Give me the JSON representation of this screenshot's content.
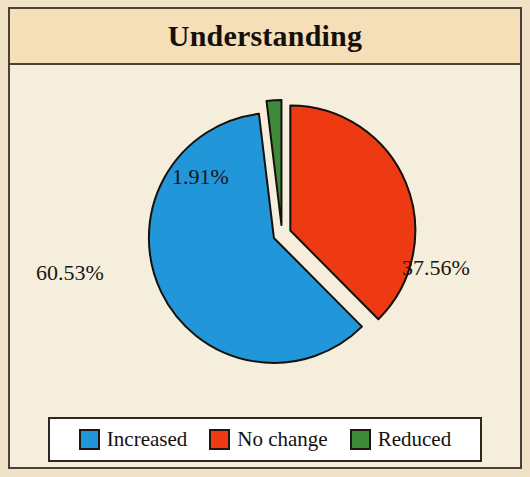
{
  "chart": {
    "title": "Understanding",
    "legend": {
      "items": [
        {
          "label": "Increased",
          "color": "#2196d8"
        },
        {
          "label": "No change",
          "color": "#ee3a13"
        },
        {
          "label": "Reduced",
          "color": "#3f8a3a"
        }
      ]
    },
    "labels": {
      "increased": "60.53%",
      "no_change": "37.56%",
      "reduced": "1.91%"
    }
  },
  "chart_data": {
    "type": "pie",
    "title": "Understanding",
    "exploded": true,
    "start_angle_deg": 0,
    "direction": "clockwise",
    "categories": [
      "No change",
      "Increased",
      "Reduced"
    ],
    "values": [
      37.56,
      60.53,
      1.91
    ],
    "unit": "percent",
    "colors": [
      "#ee3a13",
      "#2196d8",
      "#3f8a3a"
    ],
    "data_labels": [
      "37.56%",
      "60.53%",
      "1.91%"
    ],
    "legend_entries": [
      "Increased",
      "No change",
      "Reduced"
    ],
    "legend_position": "bottom",
    "xlabel": "",
    "ylabel": "",
    "grid": false,
    "slices": [
      {
        "name": "No change",
        "value": 37.56,
        "label": "37.56%",
        "color": "#ee3a13",
        "start_deg": 0.0,
        "sweep_deg": 135.22
      },
      {
        "name": "Increased",
        "value": 60.53,
        "label": "60.53%",
        "color": "#2196d8",
        "start_deg": 135.22,
        "sweep_deg": 217.91
      },
      {
        "name": "Reduced",
        "value": 1.91,
        "label": "1.91%",
        "color": "#3f8a3a",
        "start_deg": 353.13,
        "sweep_deg": 6.87
      }
    ]
  }
}
